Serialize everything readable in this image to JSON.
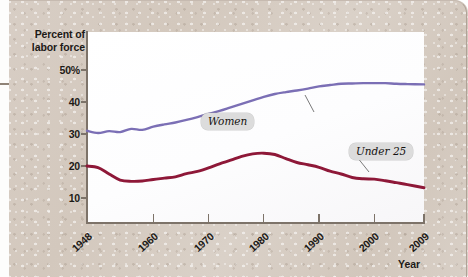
{
  "figure": {
    "y_axis_title": "Percent of labor force",
    "x_axis_title": "Year"
  },
  "labels": {
    "women": "Women",
    "under25": "Under 25"
  },
  "chart_data": {
    "type": "line",
    "title": "",
    "xlabel": "Year",
    "ylabel": "Percent of labor force",
    "xlim": [
      1948,
      2009
    ],
    "ylim": [
      0,
      55
    ],
    "yticks": [
      10,
      20,
      30,
      40,
      50
    ],
    "ytick_labels": [
      "10",
      "20",
      "30",
      "40",
      "50%"
    ],
    "xticks": [
      1948,
      1960,
      1970,
      1980,
      1990,
      2000,
      2009
    ],
    "xtick_labels": [
      "1948",
      "1960",
      "1970",
      "1980",
      "1990",
      "2000",
      "2009"
    ],
    "grid": false,
    "legend": "inline annotations",
    "annotations": [
      {
        "text": "Women",
        "series": "Women",
        "at_year": 1982
      },
      {
        "text": "Under 25",
        "series": "Under 25",
        "at_year": 1997
      }
    ],
    "series": [
      {
        "name": "Women",
        "color": "#7b6fb5",
        "x": [
          1948,
          1950,
          1952,
          1954,
          1956,
          1958,
          1960,
          1962,
          1964,
          1966,
          1968,
          1970,
          1972,
          1974,
          1976,
          1978,
          1980,
          1982,
          1984,
          1986,
          1988,
          1990,
          1992,
          1994,
          1996,
          1998,
          2000,
          2002,
          2004,
          2006,
          2009
        ],
        "values": [
          31.0,
          30.3,
          30.9,
          30.6,
          31.6,
          31.3,
          32.3,
          33.0,
          33.6,
          34.4,
          35.3,
          36.3,
          37.2,
          38.3,
          39.4,
          40.5,
          41.6,
          42.5,
          43.1,
          43.6,
          44.2,
          44.9,
          45.3,
          45.7,
          45.8,
          45.9,
          45.9,
          45.9,
          45.7,
          45.6,
          45.5
        ]
      },
      {
        "name": "Under 25",
        "color": "#8e1838",
        "x": [
          1948,
          1950,
          1952,
          1954,
          1956,
          1958,
          1960,
          1962,
          1964,
          1966,
          1968,
          1970,
          1972,
          1974,
          1976,
          1978,
          1980,
          1982,
          1984,
          1986,
          1988,
          1990,
          1992,
          1994,
          1996,
          1998,
          2000,
          2002,
          2004,
          2006,
          2009
        ],
        "values": [
          20.0,
          19.5,
          17.5,
          15.6,
          15.2,
          15.3,
          15.8,
          16.2,
          16.6,
          17.6,
          18.3,
          19.4,
          20.7,
          21.8,
          23.0,
          23.8,
          24.0,
          23.6,
          22.3,
          21.1,
          20.4,
          19.6,
          18.4,
          17.5,
          16.4,
          16.0,
          15.9,
          15.4,
          14.8,
          14.2,
          13.2
        ]
      }
    ]
  }
}
